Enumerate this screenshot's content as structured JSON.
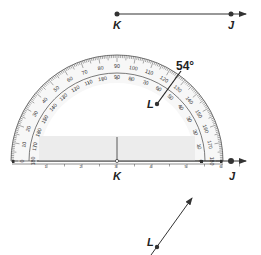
{
  "diagram": {
    "angle_value": "54°",
    "top_ray": {
      "vertex_label": "K",
      "point_label": "J"
    },
    "protractor_ray": {
      "vertex_label": "K",
      "point_label": "J",
      "side_point_label": "L"
    },
    "bottom_ray": {
      "point_label": "L"
    },
    "outer_scale": [
      "0",
      "10",
      "20",
      "30",
      "40",
      "50",
      "60",
      "70",
      "80",
      "90",
      "100",
      "110",
      "120",
      "130",
      "140",
      "150",
      "160",
      "170",
      "180"
    ],
    "inner_scale": [
      "180",
      "170",
      "160",
      "150",
      "140",
      "130",
      "120",
      "110",
      "100",
      "90",
      "80",
      "70",
      "60",
      "50",
      "40",
      "30",
      "20",
      "10",
      "0"
    ],
    "ruler_numbers": [
      "1",
      "2",
      "3",
      "4",
      "5",
      "6"
    ],
    "colors": {
      "line": "#333333",
      "band": "#ececec",
      "protractor_fill": "#f7f7f7"
    }
  }
}
